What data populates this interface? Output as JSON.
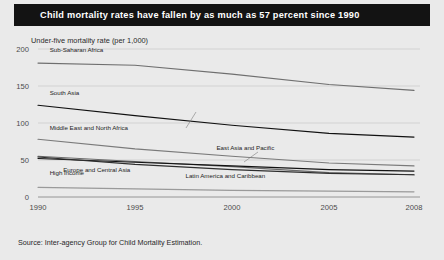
{
  "header": {
    "title": "Child mortality rates have fallen by as much as 57 percent since 1990"
  },
  "subtitle": "Under-five mortality rate (per 1,000)",
  "source": "Source: Inter-agency Group for Child Mortality Estimation.",
  "colors": {
    "header_bg": "#131313",
    "header_text": "#ffffff",
    "page_bg": "#eaeaea",
    "grid": "#c9c9c9",
    "axis": "#8d8d8d",
    "line_dark": "#111111",
    "line_mid": "#5a5a5a",
    "line_light": "#9a9a9a"
  },
  "chart_data": {
    "type": "line",
    "title": "Child mortality rates have fallen by as much as 57 percent since 1990",
    "subtitle": "Under-five mortality rate (per 1,000)",
    "xlabel": "",
    "ylabel": "Under-five mortality rate (per 1,000)",
    "x": [
      1990,
      1995,
      2000,
      2005,
      2008
    ],
    "xticklabels": [
      "1990",
      "1995",
      "2000",
      "2005",
      "2008"
    ],
    "yticks": [
      0,
      50,
      100,
      150,
      200
    ],
    "yticklabels": [
      "0",
      "50",
      "100",
      "150",
      "200"
    ],
    "ylim": [
      0,
      200
    ],
    "xlim": [
      1990,
      2008
    ],
    "grid": true,
    "legend": "inline-labels",
    "series": [
      {
        "name": "Sub-Saharan Africa",
        "values": [
          181,
          178,
          166,
          152,
          144
        ],
        "color": "#6f6f6f",
        "label_x": 1990.6,
        "label_y": 196
      },
      {
        "name": "South Asia",
        "values": [
          124,
          110,
          97,
          86,
          81
        ],
        "color": "#111111",
        "label_x": 1990.6,
        "label_y": 138
      },
      {
        "name": "Middle East and North Africa",
        "values": [
          78,
          65,
          55,
          46,
          42
        ],
        "color": "#7a7a7a",
        "label_x": 1990.6,
        "label_y": 90
      },
      {
        "name": "East Asia and Pacific",
        "values": [
          55,
          48,
          41,
          33,
          30
        ],
        "color": "#6a6a6a",
        "label_x": 1999.2,
        "label_y": 64
      },
      {
        "name": "Europe and Central Asia",
        "values": [
          52,
          47,
          42,
          37,
          35
        ],
        "color": "#121212",
        "label_x": 1991.3,
        "label_y": 34
      },
      {
        "name": "Latin America and Caribbean",
        "values": [
          54,
          44,
          37,
          32,
          30
        ],
        "color": "#2e2e2e",
        "label_x": 1997.6,
        "label_y": 26
      },
      {
        "name": "High income",
        "values": [
          13,
          11,
          9,
          8,
          7
        ],
        "color": "#9a9a9a",
        "label_x": 1990.6,
        "label_y": 30
      }
    ]
  }
}
